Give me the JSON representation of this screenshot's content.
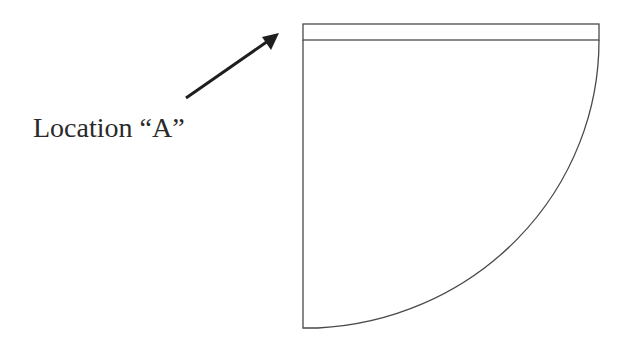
{
  "diagram": {
    "label": "Location “A”",
    "colors": {
      "stroke": "#4a4a4a",
      "arrow": "#1e1e1e",
      "text": "#2a2a2a",
      "background": "#ffffff"
    },
    "shapes": [
      {
        "type": "rect-band",
        "name": "top-band",
        "x": 303,
        "y": 24,
        "width": 296,
        "height": 16
      },
      {
        "type": "quarter-ellipse",
        "name": "quarter-sector",
        "cx": 303,
        "cy": 40,
        "rx": 296,
        "ry": 288
      },
      {
        "type": "arrow",
        "name": "pointer-arrow",
        "from": [
          186,
          98
        ],
        "to": [
          278,
          34
        ]
      }
    ]
  }
}
